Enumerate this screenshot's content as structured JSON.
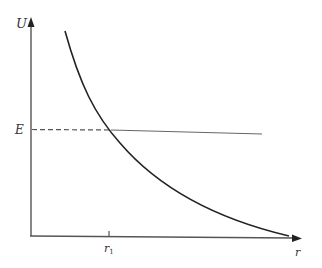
{
  "diagram": {
    "axes": {
      "y_label": "U",
      "x_label": "r"
    },
    "labels": {
      "energy_level": "E",
      "r1_main": "r",
      "r1_sub": "1"
    },
    "elements": [
      {
        "type": "curve",
        "description": "decreasing convex curve U(r)"
      },
      {
        "type": "horizontal-line",
        "label": "E",
        "dashed_segment": "from U-axis to intersection",
        "solid_segment": "beyond intersection"
      },
      {
        "type": "tick",
        "axis": "r",
        "label": "r1",
        "at": "intersection of curve and E line"
      }
    ],
    "colors": {
      "axis": "#555555",
      "curve": "#222222",
      "energy_line": "#666666",
      "background": "#ffffff"
    }
  }
}
